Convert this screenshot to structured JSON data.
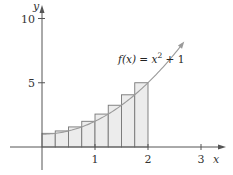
{
  "chart_data": {
    "type": "bar",
    "title": "",
    "function_label": {
      "prefix": "f(x) = x",
      "exponent": "2",
      "suffix": " + 1"
    },
    "function": "x^2 + 1",
    "xlabel": "x",
    "ylabel": "y",
    "xlim": [
      0,
      3
    ],
    "ylim": [
      0,
      10
    ],
    "x_ticks": [
      1,
      2,
      3
    ],
    "x_tick_labels": [
      "1",
      "2",
      "3"
    ],
    "y_ticks": [
      5,
      10
    ],
    "y_tick_labels": [
      "5",
      "10"
    ],
    "grid": false,
    "rectangles": {
      "count": 8,
      "width": 0.25,
      "method": "right-endpoint",
      "x_left": [
        0,
        0.25,
        0.5,
        0.75,
        1.0,
        1.25,
        1.5,
        1.75
      ],
      "heights": [
        1.0625,
        1.25,
        1.5625,
        2.0,
        2.5625,
        3.25,
        4.0625,
        5.0
      ]
    },
    "curve_domain": [
      -0.0,
      2.65
    ],
    "colors": {
      "axis": "#555555",
      "curve": "#9a9a9a",
      "rect_fill": "#ececec",
      "rect_stroke": "#777777"
    }
  }
}
